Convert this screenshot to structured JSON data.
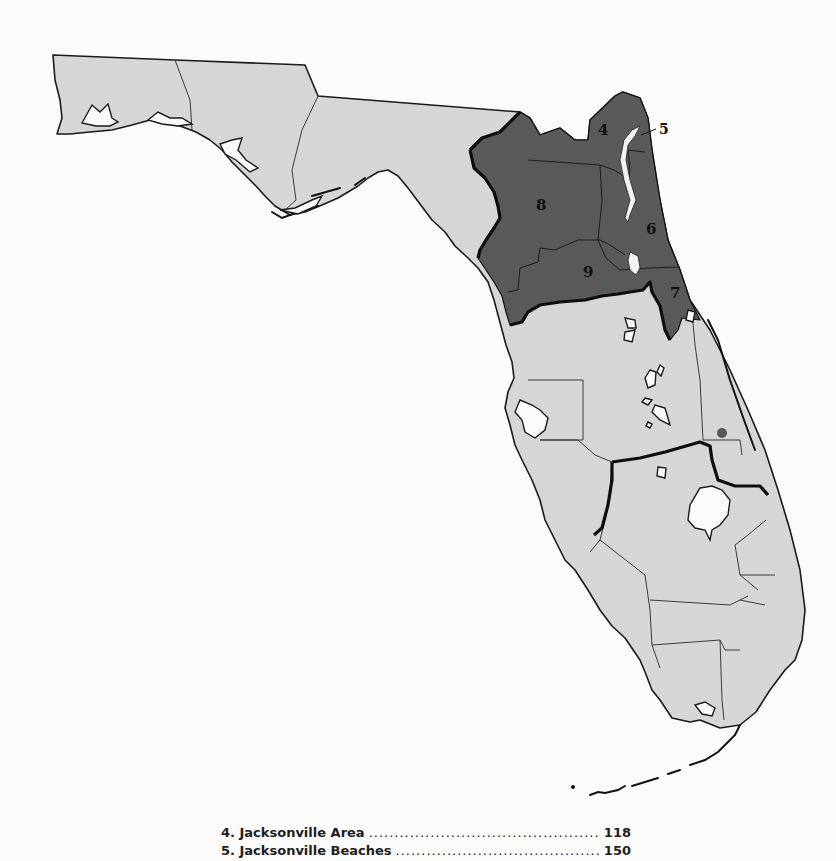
{
  "map": {
    "title": "Florida regions map",
    "colors": {
      "background": "#fbfbfa",
      "land": "#d6d6d4",
      "highlighted_region": "#5a5a5a",
      "border": "#111111"
    },
    "region_labels": [
      {
        "id": "4",
        "label": "4"
      },
      {
        "id": "5",
        "label": "5"
      },
      {
        "id": "6",
        "label": "6"
      },
      {
        "id": "7",
        "label": "7"
      },
      {
        "id": "8",
        "label": "8"
      },
      {
        "id": "9",
        "label": "9"
      }
    ]
  },
  "legend": {
    "items": [
      {
        "name": "4. Jacksonville Area",
        "page": "118"
      },
      {
        "name": "5. Jacksonville Beaches",
        "page": "150"
      }
    ]
  }
}
